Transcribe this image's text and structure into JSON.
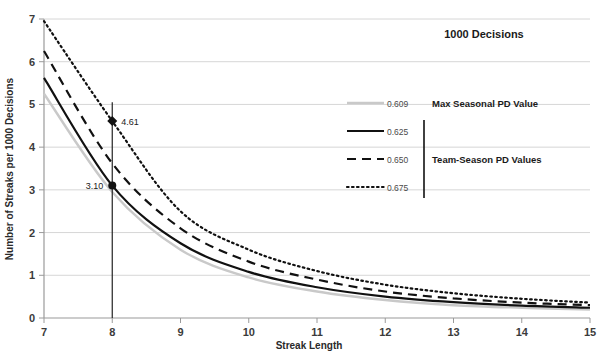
{
  "chart_data": {
    "type": "line",
    "title": "1000 Decisions",
    "xlabel": "Streak Length",
    "ylabel": "Number of Streaks per 1000 Decisions",
    "xlim": [
      7,
      15
    ],
    "ylim": [
      0,
      7
    ],
    "grid": true,
    "x_ticks": [
      "7",
      "8",
      "9",
      "10",
      "11",
      "12",
      "13",
      "14",
      "15"
    ],
    "y_ticks": [
      "0",
      "1",
      "2",
      "3",
      "4",
      "5",
      "6",
      "7"
    ],
    "x": [
      7,
      8,
      9,
      10,
      11,
      12,
      13,
      14,
      15
    ],
    "legend_position": "inside-right",
    "series": [
      {
        "name": "0.609",
        "group": "Max Seasonal PD Value",
        "style": "solid-gray",
        "color": "#c9c9c9",
        "values": [
          5.25,
          2.95,
          1.6,
          0.95,
          0.62,
          0.42,
          0.3,
          0.24,
          0.2
        ]
      },
      {
        "name": "0.625",
        "group": "Team-Season PD Values",
        "style": "solid-black",
        "color": "#111111",
        "values": [
          5.62,
          3.1,
          1.75,
          1.08,
          0.72,
          0.5,
          0.37,
          0.29,
          0.24
        ]
      },
      {
        "name": "0.650",
        "group": "Team-Season PD Values",
        "style": "dashed",
        "color": "#111111",
        "values": [
          6.25,
          3.62,
          2.1,
          1.32,
          0.9,
          0.62,
          0.46,
          0.36,
          0.3
        ]
      },
      {
        "name": "0.675",
        "group": "Team-Season PD Values",
        "style": "dotted",
        "color": "#111111",
        "values": [
          6.95,
          4.61,
          2.5,
          1.6,
          1.1,
          0.78,
          0.58,
          0.45,
          0.36
        ]
      }
    ],
    "annotations": [
      {
        "label": "4.61",
        "x": 8,
        "y": 4.61,
        "marker": "diamond",
        "label_side": "right"
      },
      {
        "label": "3.10",
        "x": 8,
        "y": 3.1,
        "marker": "circle",
        "label_side": "left"
      }
    ],
    "reference_line": {
      "x": 8,
      "y_from": 0,
      "y_to": 5.05
    }
  },
  "legend": {
    "groups": [
      {
        "label": "Max Seasonal PD Value",
        "entries": [
          {
            "value": "0.609",
            "style": "solid-gray"
          }
        ]
      },
      {
        "label": "Team-Season PD Values",
        "entries": [
          {
            "value": "0.625",
            "style": "solid-black"
          },
          {
            "value": "0.650",
            "style": "dashed"
          },
          {
            "value": "0.675",
            "style": "dotted"
          }
        ]
      }
    ]
  }
}
